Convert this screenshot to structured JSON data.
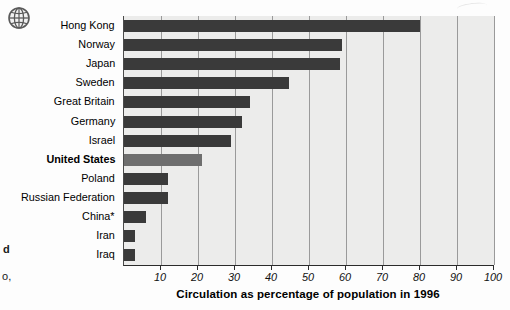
{
  "icons": {
    "globe": "globe-icon"
  },
  "margin_fragments": {
    "line1": "d",
    "line2": "o,"
  },
  "chart_data": {
    "type": "bar",
    "orientation": "horizontal",
    "title": "",
    "xlabel": "Circulation as percentage of population in 1996",
    "ylabel": "",
    "xlim": [
      0,
      100
    ],
    "xticks": [
      10,
      20,
      30,
      40,
      50,
      60,
      70,
      80,
      90,
      100
    ],
    "grid": true,
    "legend": "none",
    "categories": [
      "Hong Kong",
      "Norway",
      "Japan",
      "Sweden",
      "Great Britain",
      "Germany",
      "Israel",
      "United States",
      "Poland",
      "Russian Federation",
      "China*",
      "Iran",
      "Iraq"
    ],
    "values": [
      80,
      59,
      58.5,
      44.5,
      34,
      32,
      29,
      21,
      12,
      12,
      6,
      3,
      3
    ],
    "highlighted_category": "United States",
    "colors": {
      "bar": "#3a3a3a",
      "bar_highlight": "#6e6e6e",
      "plot_background": "#ececeb",
      "gridline": "#9a9a9a",
      "axis": "#2b2b2b"
    },
    "footnote_marker": "*"
  }
}
